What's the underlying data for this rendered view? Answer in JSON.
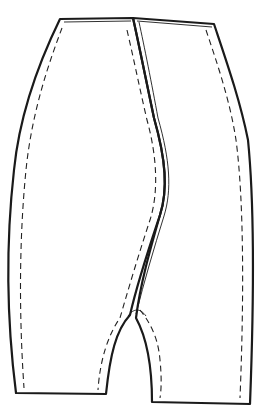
{
  "diagram": {
    "colors": {
      "background": "#ffffff",
      "line": "#1a1a1a"
    },
    "pieces": [
      {
        "name": "left-leg-panel"
      },
      {
        "name": "right-leg-panel"
      }
    ],
    "features": [
      "waistband-edge",
      "center-seam",
      "crotch-curve",
      "hem-edge",
      "seam-allowance-dashed-lines"
    ]
  }
}
